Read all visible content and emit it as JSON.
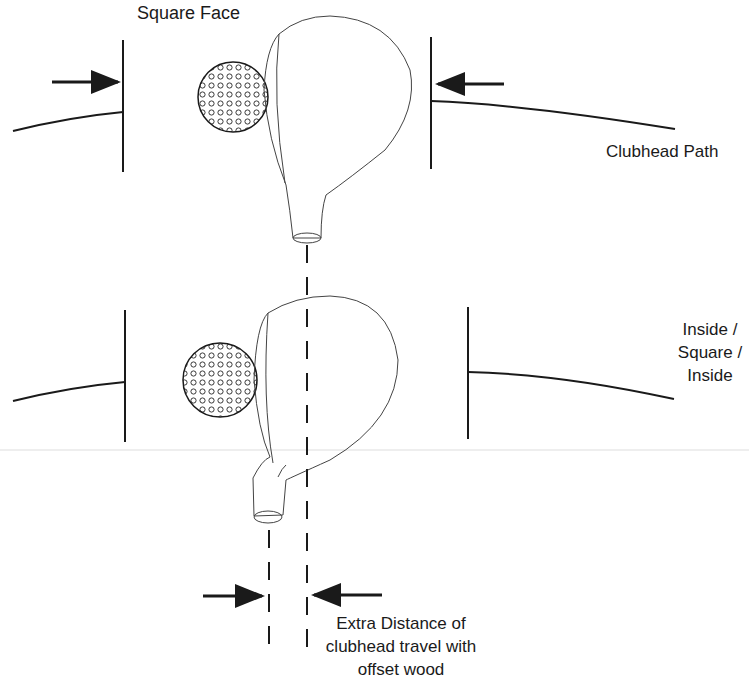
{
  "diagram": {
    "title": "Square Face",
    "top_panel": {
      "path_label": "Clubhead Path"
    },
    "bottom_panel": {
      "path_label_lines": [
        "Inside /",
        "Square /",
        "Inside"
      ]
    },
    "annotation": {
      "lines": [
        "Extra Distance of",
        "clubhead travel with",
        "offset wood"
      ]
    },
    "colors": {
      "stroke": "#1a1a1a",
      "thin_stroke": "#555555",
      "background": "#ffffff"
    }
  }
}
